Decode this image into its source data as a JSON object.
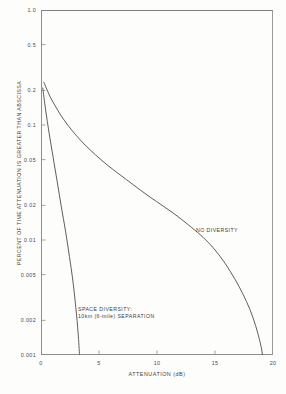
{
  "chart_data": {
    "type": "line",
    "title": "",
    "xlabel": "ATTENUATION (dB)",
    "ylabel": "PERCENT OF TIME ATTENUATION IS GREATER THAN ABSCISSA",
    "xlim": [
      0,
      20
    ],
    "ylim": [
      0.001,
      1.0
    ],
    "yscale": "log",
    "xscale": "linear",
    "grid": false,
    "legend_position": "inline-annotations",
    "xticks": [
      {
        "value": 0,
        "label": "0"
      },
      {
        "value": 5,
        "label": "5"
      },
      {
        "value": 10,
        "label": "10"
      },
      {
        "value": 15,
        "label": "15"
      },
      {
        "value": 20,
        "label": "20"
      }
    ],
    "yticks": [
      {
        "value": 1.0,
        "label": "1.0"
      },
      {
        "value": 0.5,
        "label": "0.5"
      },
      {
        "value": 0.2,
        "label": "0.2"
      },
      {
        "value": 0.1,
        "label": "0.1"
      },
      {
        "value": 0.05,
        "label": "0.05"
      },
      {
        "value": 0.02,
        "label": "0.02"
      },
      {
        "value": 0.01,
        "label": "0.01"
      },
      {
        "value": 0.005,
        "label": "0.005"
      },
      {
        "value": 0.002,
        "label": "0.002"
      },
      {
        "value": 0.001,
        "label": "0.001"
      }
    ],
    "series": [
      {
        "name": "NO DIVERSITY",
        "label": "NO DIVERSITY",
        "color": "#555555",
        "points": [
          {
            "x": 0.25,
            "y": 0.235
          },
          {
            "x": 0.5,
            "y": 0.205
          },
          {
            "x": 0.8,
            "y": 0.175
          },
          {
            "x": 1.2,
            "y": 0.148
          },
          {
            "x": 1.7,
            "y": 0.122
          },
          {
            "x": 2.3,
            "y": 0.1
          },
          {
            "x": 3.0,
            "y": 0.082
          },
          {
            "x": 3.8,
            "y": 0.067
          },
          {
            "x": 4.7,
            "y": 0.055
          },
          {
            "x": 5.7,
            "y": 0.045
          },
          {
            "x": 6.8,
            "y": 0.037
          },
          {
            "x": 8.0,
            "y": 0.03
          },
          {
            "x": 9.3,
            "y": 0.024
          },
          {
            "x": 10.6,
            "y": 0.0195
          },
          {
            "x": 11.8,
            "y": 0.016
          },
          {
            "x": 13.0,
            "y": 0.0128
          },
          {
            "x": 14.0,
            "y": 0.0105
          },
          {
            "x": 15.0,
            "y": 0.0082
          },
          {
            "x": 15.9,
            "y": 0.0062
          },
          {
            "x": 16.7,
            "y": 0.0046
          },
          {
            "x": 17.4,
            "y": 0.0034
          },
          {
            "x": 18.0,
            "y": 0.0025
          },
          {
            "x": 18.5,
            "y": 0.0018
          },
          {
            "x": 18.9,
            "y": 0.00128
          },
          {
            "x": 19.1,
            "y": 0.001
          }
        ]
      },
      {
        "name": "SPACE DIVERSITY: 10km (6-mile) SEPARATION",
        "label_line1": "SPACE DIVERSITY:",
        "label_line2": "10km (6-mile) SEPARATION",
        "color": "#555555",
        "points": [
          {
            "x": 0.15,
            "y": 0.21
          },
          {
            "x": 0.4,
            "y": 0.135
          },
          {
            "x": 0.7,
            "y": 0.085
          },
          {
            "x": 1.05,
            "y": 0.052
          },
          {
            "x": 1.4,
            "y": 0.032
          },
          {
            "x": 1.75,
            "y": 0.0195
          },
          {
            "x": 2.1,
            "y": 0.0122
          },
          {
            "x": 2.45,
            "y": 0.0072
          },
          {
            "x": 2.75,
            "y": 0.0044
          },
          {
            "x": 3.0,
            "y": 0.0026
          },
          {
            "x": 3.2,
            "y": 0.00155
          },
          {
            "x": 3.32,
            "y": 0.001
          }
        ]
      }
    ],
    "annotations": [
      {
        "id": "no-diversity",
        "text": "NO DIVERSITY"
      },
      {
        "id": "space-diversity-line1",
        "text": "SPACE DIVERSITY:"
      },
      {
        "id": "space-diversity-line2",
        "text": "10km (6-mile) SEPARATION"
      }
    ]
  },
  "caption": {
    "sliver_text": ""
  },
  "colors": {
    "background": "#fdfdfc",
    "frame": "#8e8e8e",
    "curve": "#555555",
    "text": "#3f3f3f",
    "tick_text": "#4a4a4a"
  }
}
